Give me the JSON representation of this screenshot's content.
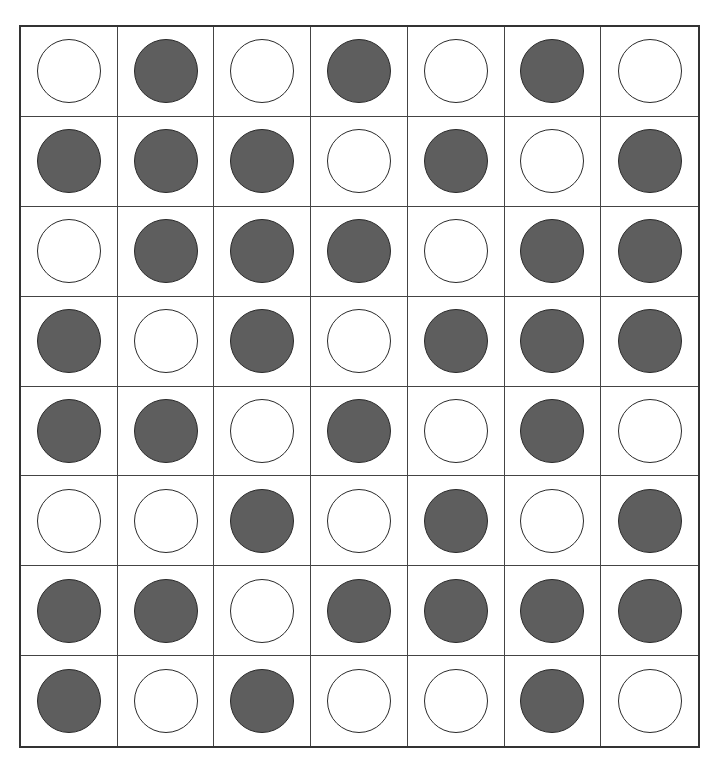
{
  "grid": {
    "rows": 8,
    "cols": 7,
    "colors": {
      "filled": "#5e5e5e",
      "empty": "#ffffff",
      "stroke": "#2a2a2a",
      "gridline": "#444444"
    },
    "cells": [
      [
        "empty",
        "filled",
        "empty",
        "filled",
        "empty",
        "filled",
        "empty"
      ],
      [
        "filled",
        "filled",
        "filled",
        "empty",
        "filled",
        "empty",
        "filled"
      ],
      [
        "empty",
        "filled",
        "filled",
        "filled",
        "empty",
        "filled",
        "filled"
      ],
      [
        "filled",
        "empty",
        "filled",
        "empty",
        "filled",
        "filled",
        "filled"
      ],
      [
        "filled",
        "filled",
        "empty",
        "filled",
        "empty",
        "filled",
        "empty"
      ],
      [
        "empty",
        "empty",
        "filled",
        "empty",
        "filled",
        "empty",
        "filled"
      ],
      [
        "filled",
        "filled",
        "empty",
        "filled",
        "filled",
        "filled",
        "filled"
      ],
      [
        "filled",
        "empty",
        "filled",
        "empty",
        "empty",
        "filled",
        "empty"
      ]
    ]
  }
}
